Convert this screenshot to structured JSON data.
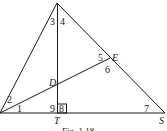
{
  "figure": {
    "caption": "Fig. 1.18",
    "points": {
      "D": "D",
      "E": "E",
      "T": "T",
      "S": "S"
    },
    "angles": [
      "1",
      "2",
      "3",
      "4",
      "5",
      "6",
      "7",
      "8",
      "9"
    ],
    "right_angle_at": "T"
  }
}
